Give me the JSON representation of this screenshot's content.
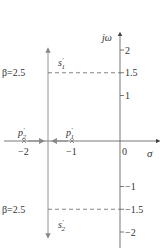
{
  "diagram": {
    "type": "root-locus-s-plane",
    "axes": {
      "real_label": "σ",
      "imag_label": "jω",
      "real_ticks": [
        {
          "value": -2,
          "label": "−2"
        },
        {
          "value": -1,
          "label": "−1"
        },
        {
          "value": 0,
          "label": "0"
        }
      ],
      "imag_ticks": [
        {
          "value": 2,
          "label": "2"
        },
        {
          "value": 1.5,
          "label": "1.5"
        },
        {
          "value": 1,
          "label": "1"
        },
        {
          "value": -1,
          "label": "−1"
        },
        {
          "value": -1.5,
          "label": "−1.5"
        },
        {
          "value": -2,
          "label": "−2"
        }
      ]
    },
    "poles": [
      {
        "name": "p1",
        "label": "p",
        "prime": "′",
        "sub": "1",
        "re": -1,
        "im": 0
      },
      {
        "name": "p2",
        "label": "p",
        "prime": "′",
        "sub": "2",
        "re": -2,
        "im": 0
      }
    ],
    "locus_branches": [
      {
        "name": "s1",
        "label": "s",
        "prime": "′",
        "sub": "1",
        "re": -1.5,
        "direction": "up"
      },
      {
        "name": "s2",
        "label": "s",
        "prime": "′",
        "sub": "2",
        "re": -1.5,
        "direction": "down"
      }
    ],
    "gain_markers": [
      {
        "label": "β=2.5",
        "im": 1.5
      },
      {
        "label": "β=2.5",
        "im": -1.5
      }
    ],
    "colors": {
      "axis": "#555555",
      "locus": "#888888",
      "dashed": "#666666",
      "text": "#333333"
    }
  }
}
